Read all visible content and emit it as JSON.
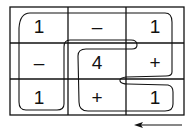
{
  "grid": {
    "rows": 3,
    "cols": 3,
    "cells": [
      [
        "1",
        "–",
        "1"
      ],
      [
        "–",
        "4",
        "+"
      ],
      [
        "1",
        "+",
        "1"
      ]
    ]
  },
  "arrow": {
    "direction": "left"
  },
  "colors": {
    "ink": "#111111",
    "background": "#ffffff"
  }
}
